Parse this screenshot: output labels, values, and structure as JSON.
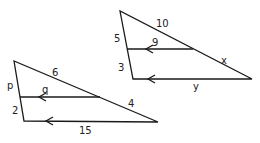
{
  "diagram": {
    "type": "similar-triangles-side-splitter",
    "triangles": [
      {
        "name": "left-triangle",
        "labels": {
          "p": "p",
          "q": "q",
          "six": "6",
          "four": "4",
          "two": "2",
          "fifteen": "15"
        }
      },
      {
        "name": "right-triangle",
        "labels": {
          "five": "5",
          "three": "3",
          "ten": "10",
          "nine": "9",
          "x": "x",
          "y": "y"
        }
      }
    ],
    "colors": {
      "line": "#1a1a1a",
      "text": "#222222",
      "background": "#ffffff"
    }
  }
}
